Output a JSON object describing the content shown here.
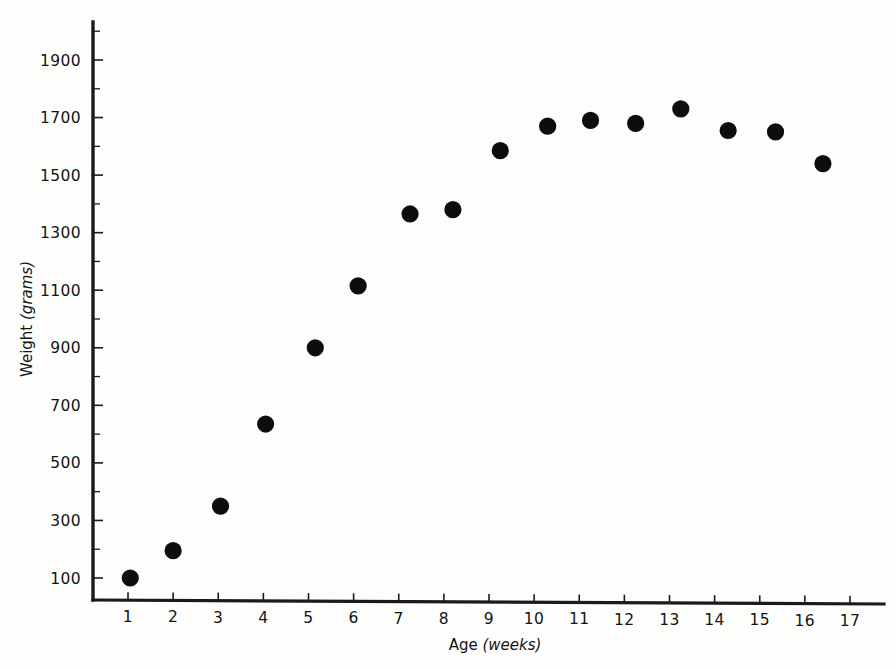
{
  "chart_data": {
    "type": "scatter",
    "title": "",
    "subtitle": "",
    "xlabel": "Age (weeks)",
    "xlabel_main": "Age",
    "xlabel_unit": "(weeks)",
    "ylabel": "Weight (grams)",
    "ylabel_main": "Weight",
    "ylabel_unit": "(grams)",
    "xlim": [
      0,
      17.6
    ],
    "ylim": [
      0,
      2000
    ],
    "grid": false,
    "legend": "none",
    "marker_style": "filled-circle",
    "marker_color": "#0d0d0d",
    "axis_color": "#1a1a1a",
    "x_ticks": [
      1,
      2,
      3,
      4,
      5,
      6,
      7,
      8,
      9,
      10,
      11,
      12,
      13,
      14,
      15,
      16,
      17
    ],
    "x_tick_labels": [
      "1",
      "2",
      "3",
      "4",
      "5",
      "6",
      "7",
      "8",
      "9",
      "10",
      "11",
      "12",
      "13",
      "14",
      "15",
      "16",
      "17"
    ],
    "y_ticks_major": [
      100,
      300,
      500,
      700,
      900,
      1100,
      1300,
      1500,
      1700,
      1900
    ],
    "y_tick_labels": [
      "100",
      "300",
      "500",
      "700",
      "900",
      "1100",
      "1300",
      "1500",
      "1700",
      "1900"
    ],
    "y_ticks_minor": [
      200,
      400,
      600,
      800,
      1000,
      1200,
      1400,
      1600,
      1800,
      2000
    ],
    "x": [
      1.05,
      2.0,
      3.05,
      4.05,
      5.15,
      6.1,
      7.25,
      8.2,
      9.25,
      10.3,
      11.25,
      12.25,
      13.25,
      14.3,
      15.35,
      16.4
    ],
    "y": [
      100,
      195,
      350,
      635,
      900,
      1115,
      1365,
      1380,
      1585,
      1670,
      1690,
      1680,
      1730,
      1655,
      1650,
      1540
    ],
    "points": [
      {
        "week": 1,
        "weight": 100
      },
      {
        "week": 2,
        "weight": 195
      },
      {
        "week": 3,
        "weight": 350
      },
      {
        "week": 4,
        "weight": 635
      },
      {
        "week": 5,
        "weight": 900
      },
      {
        "week": 6,
        "weight": 1115
      },
      {
        "week": 7,
        "weight": 1365
      },
      {
        "week": 8,
        "weight": 1380
      },
      {
        "week": 9,
        "weight": 1585
      },
      {
        "week": 10,
        "weight": 1670
      },
      {
        "week": 11,
        "weight": 1690
      },
      {
        "week": 12,
        "weight": 1680
      },
      {
        "week": 13,
        "weight": 1730
      },
      {
        "week": 14,
        "weight": 1655
      },
      {
        "week": 15,
        "weight": 1650
      },
      {
        "week": 16,
        "weight": 1540
      }
    ]
  }
}
